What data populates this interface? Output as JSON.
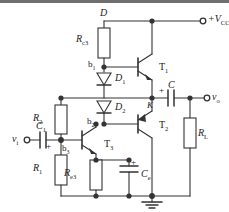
{
  "figure": {
    "kind": "circuit-schematic",
    "line_color": "#333333",
    "bg_color": "#ffffff",
    "topbar_color": "#6e6e6e"
  },
  "labels": {
    "node_d": "D",
    "node_k": "K",
    "node_b1": "b",
    "node_b1_sub": "1",
    "node_b2": "b",
    "node_b2_sub": "2",
    "node_b3": "b",
    "node_b3_sub": "3",
    "supply": "+V",
    "supply_sub": "CC",
    "input": "v",
    "input_sub": "i",
    "output": "v",
    "output_sub": "o"
  },
  "components": {
    "r_c3": {
      "name": "R",
      "sub": "c3",
      "type": "resistor"
    },
    "r_2": {
      "name": "R",
      "sub": "2",
      "type": "resistor"
    },
    "r_1": {
      "name": "R",
      "sub": "1",
      "type": "resistor"
    },
    "r_e3": {
      "name": "R",
      "sub": "e3",
      "type": "resistor"
    },
    "r_l": {
      "name": "R",
      "sub": "L",
      "type": "resistor"
    },
    "c_1": {
      "name": "C",
      "sub": "1",
      "type": "capacitor-polarized",
      "polarity": "+"
    },
    "c_o": {
      "name": "C",
      "sub": "",
      "type": "capacitor-polarized",
      "polarity": "+"
    },
    "c_e": {
      "name": "C",
      "sub": "e",
      "type": "capacitor-polarized",
      "polarity": "+"
    },
    "d_1": {
      "name": "D",
      "sub": "1",
      "type": "diode"
    },
    "d_2": {
      "name": "D",
      "sub": "2",
      "type": "diode"
    },
    "t_1": {
      "name": "T",
      "sub": "1",
      "type": "transistor-npn"
    },
    "t_2": {
      "name": "T",
      "sub": "2",
      "type": "transistor-pnp"
    },
    "t_3": {
      "name": "T",
      "sub": "3",
      "type": "transistor-npn"
    },
    "gnd": {
      "name": "ground",
      "type": "ground-symbol"
    }
  }
}
